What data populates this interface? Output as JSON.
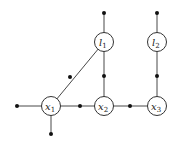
{
  "diagram": {
    "type": "factor-graph",
    "nodes": [
      {
        "id": "x1",
        "label": "x",
        "sub": "1",
        "cx": 51,
        "cy": 106
      },
      {
        "id": "x2",
        "label": "x",
        "sub": "2",
        "cx": 104,
        "cy": 106
      },
      {
        "id": "x3",
        "label": "x",
        "sub": "3",
        "cx": 157,
        "cy": 106
      },
      {
        "id": "l1",
        "label": "l",
        "sub": "1",
        "cx": 104,
        "cy": 42
      },
      {
        "id": "l2",
        "label": "l",
        "sub": "2",
        "cx": 157,
        "cy": 42
      }
    ],
    "factors": [
      {
        "id": "f-x1-left",
        "cx": 17,
        "cy": 106
      },
      {
        "id": "f-x1-bottom",
        "cx": 51,
        "cy": 134
      },
      {
        "id": "f-x1-x2",
        "cx": 80,
        "cy": 106
      },
      {
        "id": "f-x2-x3",
        "cx": 130,
        "cy": 106
      },
      {
        "id": "f-x1-l1",
        "cx": 70,
        "cy": 77
      },
      {
        "id": "f-x2-l1",
        "cx": 104,
        "cy": 76
      },
      {
        "id": "f-x3-l2",
        "cx": 157,
        "cy": 76
      },
      {
        "id": "f-l1-top",
        "cx": 104,
        "cy": 13
      },
      {
        "id": "f-l2-top",
        "cx": 157,
        "cy": 13
      }
    ]
  }
}
